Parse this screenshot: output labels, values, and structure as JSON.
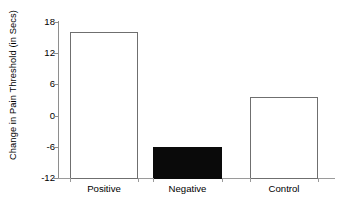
{
  "chart_data": {
    "type": "bar",
    "title": "",
    "subtitle": "",
    "xlabel": "",
    "ylabel": "Change in Pain Threshold (in Secs)",
    "categories": [
      "Positive",
      "Negative",
      "Control"
    ],
    "values": [
      16,
      -6,
      3.5
    ],
    "series": [
      {
        "name": "Change in Pain Threshold",
        "values": [
          16,
          -6,
          3.5
        ]
      }
    ],
    "bar_styles": [
      "open",
      "filled-black",
      "open"
    ],
    "ylim": [
      -12,
      18
    ],
    "yticks": [
      18,
      12,
      6,
      0,
      -6,
      -12
    ],
    "ytick_labels": [
      "18",
      "12",
      "6",
      "0",
      "-6",
      "-12"
    ],
    "baseline": -12,
    "grid": false,
    "legend": false,
    "legend_position": "none",
    "annotations": [],
    "colors": {
      "open_bar_fill": "#ffffff",
      "open_bar_edge": "#6f6f6f",
      "filled_bar_fill": "#0a0a0a",
      "axis": "#8e8e8e",
      "text": "#000000",
      "background": "#ffffff"
    }
  }
}
